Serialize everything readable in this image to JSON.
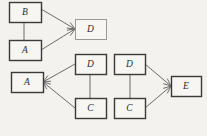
{
  "canvas": {
    "width": 207,
    "height": 136,
    "background_color": "#f4f2ee"
  },
  "style": {
    "box_fill": "#f7f6f3",
    "box_border_dark": "#3a3a3a",
    "box_border_light": "#9a9a9a",
    "edge_color": "#6b6b6b",
    "label_color": "#2b2b2b"
  },
  "diagram": {
    "type": "node-link-graph-fragments",
    "title": "",
    "groups": [
      {
        "id": "group-1",
        "name": "left-fragment",
        "nodes": [
          "n1",
          "n2",
          "n3"
        ]
      },
      {
        "id": "group-2",
        "name": "middle-fragment",
        "nodes": [
          "n4",
          "n5",
          "n6"
        ]
      },
      {
        "id": "group-3",
        "name": "right-fragment",
        "nodes": [
          "n7",
          "n8",
          "n9"
        ]
      }
    ],
    "nodes": [
      {
        "id": "n1",
        "label": "B",
        "x": 9,
        "y": 2,
        "w": 32,
        "h": 20,
        "border": "dark"
      },
      {
        "id": "n2",
        "label": "A",
        "x": 9,
        "y": 40,
        "w": 32,
        "h": 20,
        "border": "dark"
      },
      {
        "id": "n3",
        "label": "D",
        "x": 75,
        "y": 19,
        "w": 31,
        "h": 20,
        "border": "light"
      },
      {
        "id": "n4",
        "label": "A",
        "x": 11,
        "y": 72,
        "w": 32,
        "h": 20,
        "border": "dark"
      },
      {
        "id": "n5",
        "label": "D",
        "x": 75,
        "y": 54,
        "w": 31,
        "h": 20,
        "border": "dark"
      },
      {
        "id": "n6",
        "label": "C",
        "x": 75,
        "y": 98,
        "w": 31,
        "h": 20,
        "border": "dark"
      },
      {
        "id": "n7",
        "label": "D",
        "x": 114,
        "y": 54,
        "w": 31,
        "h": 20,
        "border": "dark"
      },
      {
        "id": "n8",
        "label": "C",
        "x": 114,
        "y": 98,
        "w": 31,
        "h": 20,
        "border": "dark"
      },
      {
        "id": "n9",
        "label": "E",
        "x": 171,
        "y": 76,
        "w": 30,
        "h": 20,
        "border": "dark"
      }
    ],
    "edges": [
      {
        "id": "e1",
        "from": "n1",
        "to": "n2",
        "x1": 24,
        "y1": 22,
        "x2": 24,
        "y2": 40,
        "arrow": false
      },
      {
        "id": "e2",
        "from": "n1",
        "to": "n3",
        "x1": 41,
        "y1": 9,
        "x2": 75,
        "y2": 29,
        "arrow": true
      },
      {
        "id": "e3",
        "from": "n2",
        "to": "n3",
        "x1": 41,
        "y1": 50,
        "x2": 75,
        "y2": 29,
        "arrow": true
      },
      {
        "id": "e4",
        "from": "n5",
        "to": "n4",
        "x1": 75,
        "y1": 64,
        "x2": 43,
        "y2": 82,
        "arrow": true
      },
      {
        "id": "e5",
        "from": "n6",
        "to": "n4",
        "x1": 75,
        "y1": 108,
        "x2": 43,
        "y2": 82,
        "arrow": true
      },
      {
        "id": "e6",
        "from": "n5",
        "to": "n6",
        "x1": 90,
        "y1": 74,
        "x2": 90,
        "y2": 98,
        "arrow": false
      },
      {
        "id": "e7",
        "from": "n7",
        "to": "n8",
        "x1": 130,
        "y1": 74,
        "x2": 130,
        "y2": 98,
        "arrow": false
      },
      {
        "id": "e8",
        "from": "n7",
        "to": "n9",
        "x1": 145,
        "y1": 64,
        "x2": 171,
        "y2": 86,
        "arrow": true
      },
      {
        "id": "e9",
        "from": "n8",
        "to": "n9",
        "x1": 145,
        "y1": 108,
        "x2": 171,
        "y2": 86,
        "arrow": true
      }
    ]
  }
}
